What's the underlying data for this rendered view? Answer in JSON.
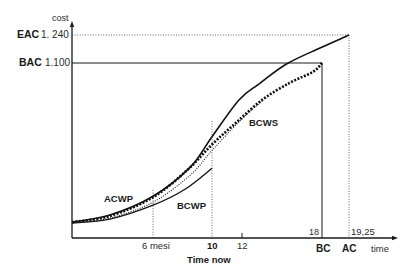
{
  "chart_data": {
    "type": "line",
    "title": "",
    "xlabel": "time",
    "ylabel": "cost",
    "grid": false,
    "legend": "inline labels on curves",
    "x_ticks": [
      {
        "value": 6,
        "label": "6 mesi"
      },
      {
        "value": 10,
        "label": "10"
      },
      {
        "value": 12,
        "label": "12"
      },
      {
        "value": 18,
        "label": "18"
      },
      {
        "value": 19.25,
        "label": "19,25"
      }
    ],
    "y_ticks": [
      {
        "name": "EAC",
        "value": 1240,
        "label": "1. 240"
      },
      {
        "name": "BAC",
        "value": 1100,
        "label": "1.100"
      }
    ],
    "x_markers": {
      "time_now": {
        "value": 10,
        "label": "Time now"
      },
      "bc": {
        "value": 18,
        "label": "BC"
      },
      "ac": {
        "value": 19.25,
        "label": "AC"
      }
    },
    "series": [
      {
        "name": "ACWP",
        "style": "solid",
        "points": [
          [
            0,
            100
          ],
          [
            2.81,
            144
          ],
          [
            6,
            262
          ],
          [
            8.51,
            444
          ],
          [
            10,
            637
          ],
          [
            11.81,
            869
          ],
          [
            13.29,
            969
          ],
          [
            15.34,
            1094
          ],
          [
            17.85,
            1175
          ],
          [
            19.25,
            1240
          ]
        ]
      },
      {
        "name": "BCWS",
        "style": "dotted-heavy",
        "points": [
          [
            0,
            100
          ],
          [
            2.81,
            138
          ],
          [
            6,
            256
          ],
          [
            8.37,
            431
          ],
          [
            10,
            588
          ],
          [
            11.61,
            725
          ],
          [
            13.52,
            869
          ],
          [
            15.57,
            975
          ],
          [
            17.32,
            1044
          ],
          [
            18,
            1100
          ]
        ]
      },
      {
        "name": "BCWP",
        "style": "solid-thin",
        "points": [
          [
            0,
            94
          ],
          [
            2.81,
            119
          ],
          [
            6,
            206
          ],
          [
            8.17,
            306
          ],
          [
            10,
            438
          ]
        ]
      },
      {
        "name": "",
        "style": "dotted-thin",
        "points": [
          [
            0,
            94
          ],
          [
            2.81,
            125
          ],
          [
            6,
            225
          ],
          [
            8.51,
            394
          ],
          [
            10,
            550
          ],
          [
            11.81,
            731
          ],
          [
            13.52,
            862
          ]
        ]
      }
    ],
    "annotations": [
      {
        "text": "ACWP",
        "x": 2.37,
        "y": 231
      },
      {
        "text": "BCWP",
        "x": 7.63,
        "y": 188
      },
      {
        "text": "BCWS",
        "x": 12.46,
        "y": 706
      }
    ]
  }
}
